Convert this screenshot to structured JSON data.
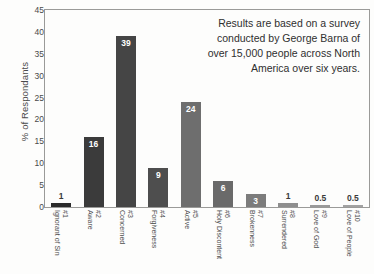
{
  "chart_data": {
    "type": "bar",
    "title": "",
    "subtitle": "",
    "xlabel": "",
    "ylabel": "% of Respondants",
    "ylim": [
      0,
      45
    ],
    "ytick_labels": [
      "0",
      "5",
      "10",
      "15",
      "20",
      "25",
      "30",
      "35",
      "40",
      "45"
    ],
    "ytick_values": [
      0,
      5,
      10,
      15,
      20,
      25,
      30,
      35,
      40,
      45
    ],
    "grid": false,
    "legend": "none",
    "categories": [
      "#1 Ignorant of Sin",
      "#2 Aware",
      "#3 Concerned",
      "#4 Forgiveness",
      "#5 Active",
      "#6 Holy Discontent",
      "#7 Brokenness",
      "#8 Surrendered",
      "#9 Love of God",
      "#10 Love of People"
    ],
    "category_numbers": [
      "#1",
      "#2",
      "#3",
      "#4",
      "#5",
      "#6",
      "#7",
      "#8",
      "#9",
      "#10"
    ],
    "category_names": [
      "Ignorant of Sin",
      "Aware",
      "Concerned",
      "Forgiveness",
      "Active",
      "Holy Discontent",
      "Brokenness",
      "Surrendered",
      "Love of God",
      "Love of People"
    ],
    "values": [
      1,
      16,
      39,
      9,
      24,
      6,
      3,
      1,
      0.5,
      0.5
    ],
    "value_labels": [
      "1",
      "16",
      "39",
      "9",
      "24",
      "6",
      "3",
      "1",
      "0.5",
      "0.5"
    ],
    "bar_colors": [
      "#2b2b2b",
      "#3b3b3b",
      "#454545",
      "#4e4e4e",
      "#6e6e6e",
      "#6a6a6a",
      "#7c7c7c",
      "#8e8e8e",
      "#9a9a9a",
      "#a2a2a2"
    ],
    "label_placement": [
      "above",
      "inside",
      "inside",
      "inside",
      "inside",
      "inside",
      "inside",
      "above",
      "above",
      "above"
    ],
    "annotation": "Results are based on a survey conducted by George Barna of over 15,000 people across North America over six years.",
    "axis_color": "#9a9a98",
    "text_color": "#4a4a4a"
  }
}
